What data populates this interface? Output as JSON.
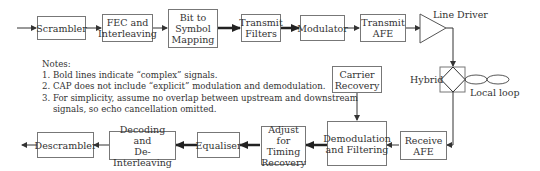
{
  "diagram": {
    "transmit_path": [
      {
        "id": "scrambler",
        "label": "Scrambler"
      },
      {
        "id": "fec",
        "label": "FEC and\nInterleaving"
      },
      {
        "id": "bit-to-symbol",
        "label": "Bit to\nSymbol\nMapping"
      },
      {
        "id": "transmit-filters",
        "label": "Transmit\nFilters"
      },
      {
        "id": "modulator",
        "label": "Modulator"
      },
      {
        "id": "transmit-afe",
        "label": "Transmit\nAFE"
      }
    ],
    "line_driver_label": "Line Driver",
    "hybrid_label": "Hybrid",
    "local_loop_label": "Local loop",
    "receive_path": [
      {
        "id": "receive-afe",
        "label": "Receive\nAFE"
      },
      {
        "id": "demodulation",
        "label": "Demodulation\nand Filtering"
      },
      {
        "id": "timing",
        "label": "Adjust for\nTiming\nRecovery"
      },
      {
        "id": "equaliser",
        "label": "Equaliser"
      },
      {
        "id": "decoding",
        "label": "Decoding and\nDe-Interleaving"
      },
      {
        "id": "descrambler",
        "label": "Descrambler"
      }
    ],
    "carrier_recovery": {
      "label": "Carrier\nRecovery"
    },
    "notes": {
      "title": "Notes:",
      "items": [
        "1. Bold lines indicate “complex” signals.",
        "2. CAP does not include “explicit” modulation and demodulation.",
        "3. For simplicity, assume no overlap between upstream and downstream",
        "    signals, so echo cancellation omitted."
      ]
    },
    "colors": {
      "line": "#333333",
      "box_border": "#777777",
      "text": "#333333"
    }
  }
}
